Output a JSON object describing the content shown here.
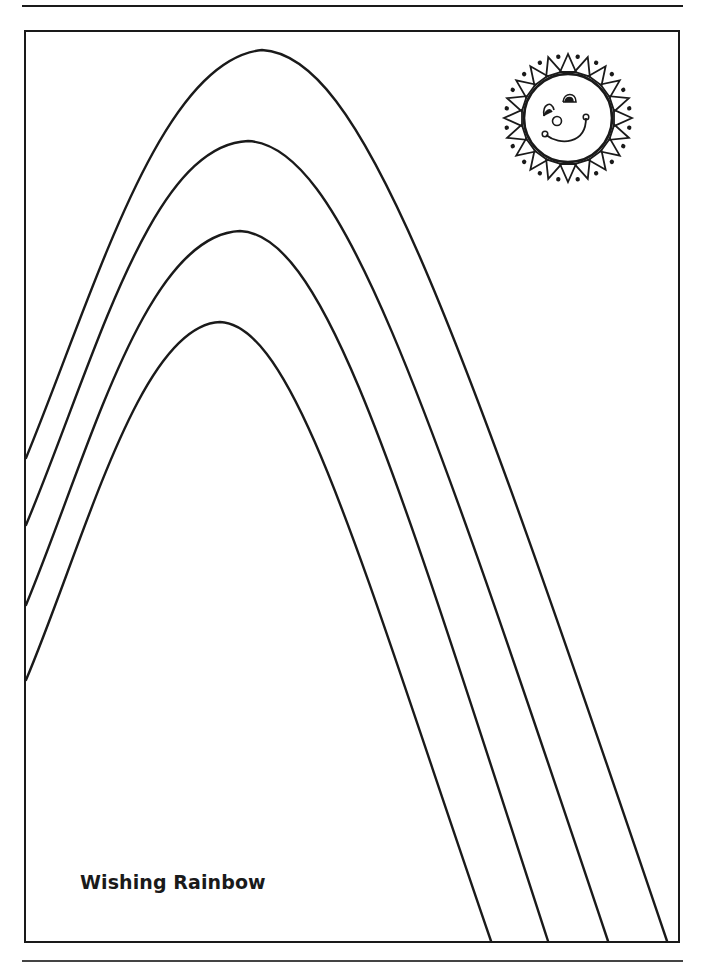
{
  "page": {
    "title": "Wishing Rainbow",
    "stroke_color": "#1a1a1a",
    "background": "#ffffff"
  },
  "artwork": {
    "rainbow_bands": 4,
    "sun": {
      "expression": "smiling",
      "rays": 20,
      "dots": 20
    }
  }
}
